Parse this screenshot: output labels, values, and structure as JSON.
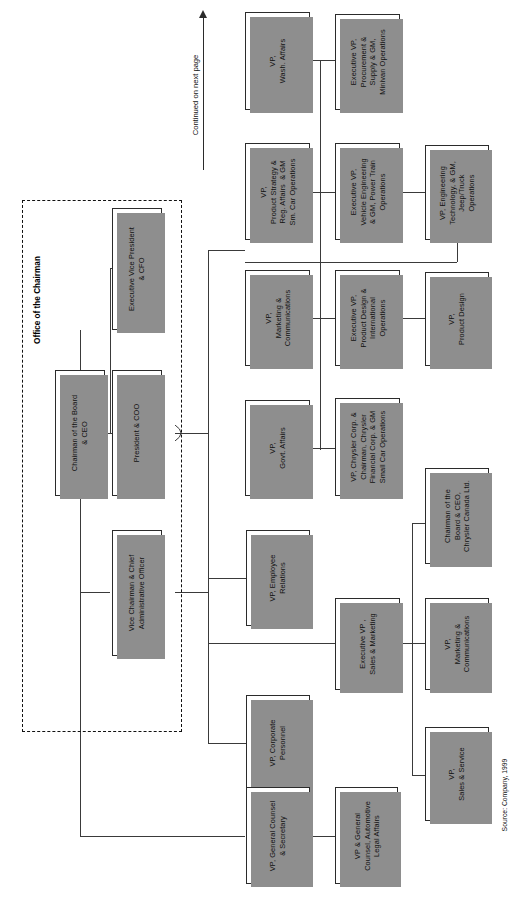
{
  "chart_title": "Office of the Chairman",
  "orientation": "rotated-90-counterclockwise",
  "group": {
    "label": "Office of the Chairman"
  },
  "continuation": {
    "label": "Continued on next page",
    "icon": "up-arrow-icon"
  },
  "source": {
    "label": "Source: Company, 1999"
  },
  "nodes": {
    "chairman_ceo": {
      "label": "Chairman of the Board\n& CEO"
    },
    "evp_cfo": {
      "label": "Executive Vice President\n& CFO"
    },
    "president_coo": {
      "label": "President & COO"
    },
    "vice_chairman_cao": {
      "label": "Vice Chairman & Chief\nAdministrative Officer"
    },
    "vp_wash_affairs": {
      "label": "VP,\nWash. Affairs"
    },
    "evp_procurement": {
      "label": "Executive VP,\nProcurement &\nSupply & GM,\nMinivan Operations"
    },
    "vp_product_strategy": {
      "label": "VP,\nProduct Strategy &\nReg. Affairs  & GM\nSm. Car Operations"
    },
    "evp_vehicle_eng": {
      "label": "Executive VP,\nVehicle Engineering\n& GM, Power Train\nOperations"
    },
    "vp_eng_tech_jeep": {
      "label": "VP, Engineering\nTechnology, & GM,\nJeep/Truck\nOperations"
    },
    "vp_marketing_comms_1": {
      "label": "VP,\nMarketing &\nCommunications"
    },
    "evp_product_design": {
      "label": "Executive VP,\nProduct Design &\nInternational\nOperations"
    },
    "vp_product_design": {
      "label": "VP,\nProduct Design"
    },
    "vp_govt_affairs": {
      "label": "VP,\nGovt. Affairs"
    },
    "vp_chrysler_corp": {
      "label": "VP, Chrysler Corp. &\nChairman, Chrysler\nFinancial Corp. & GM\nSmall Car Operations"
    },
    "chairman_canada": {
      "label": "Chairman of the\nBoard & CEO,\nChrysler Canada Ltd."
    },
    "vp_employee_relations": {
      "label": "VP, Employee\nRelations"
    },
    "evp_sales_marketing": {
      "label": "Executive VP ,\nSales & Marketing"
    },
    "vp_marketing_comms_2": {
      "label": "VP,\nMarketing &\nCommunications"
    },
    "vp_corporate_personnel": {
      "label": "VP, Corporate\nPersonnel"
    },
    "vp_sales_service": {
      "label": "VP,\nSales & Service"
    },
    "vp_general_counsel": {
      "label": "VP, General Counsel\n& Secretary"
    },
    "vp_gc_automotive": {
      "label": "VP & General\nCounsel, Automotive\nLegal Affairs"
    }
  },
  "colors": {
    "box_border": "#2b2b2b",
    "box_fill": "#ffffff",
    "shadow": "#8e8e8e",
    "line": "#3a3a3a",
    "text": "#111111"
  }
}
